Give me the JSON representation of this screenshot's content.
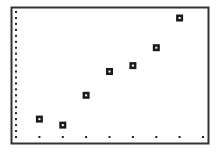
{
  "chart_data": {
    "type": "scatter",
    "title": "",
    "xlabel": "",
    "ylabel": "",
    "x": [
      1,
      2,
      3,
      4,
      5,
      6,
      7
    ],
    "series": [
      {
        "name": "Plot1",
        "marker": "box",
        "values": [
          3,
          2,
          7,
          11,
          12,
          15,
          20
        ]
      }
    ],
    "xlim": [
      0,
      8
    ],
    "ylim": [
      0,
      21
    ],
    "x_tick_step": 1,
    "y_tick_step": 1,
    "grid": false,
    "axes_style": "tick-dots (graphing calculator)",
    "legend": null
  },
  "style": {
    "frame_color": "#333333",
    "marker_color": "#1a1a1a",
    "tick_color": "#222222",
    "background": "#ffffff"
  }
}
